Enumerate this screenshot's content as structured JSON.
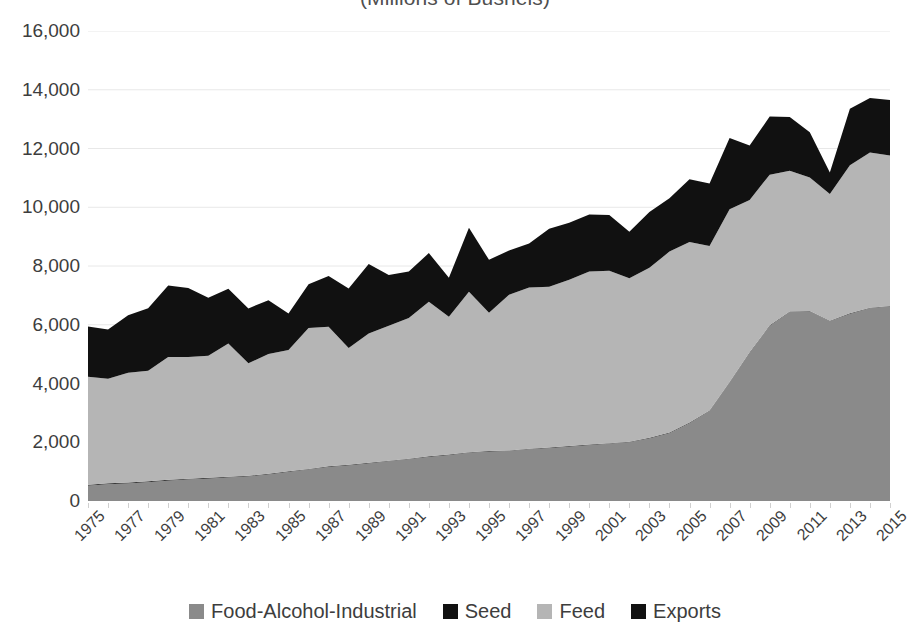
{
  "chart_data": {
    "type": "area",
    "title": "(Millions of Bushels)",
    "xlabel": "",
    "ylabel": "",
    "stacked": true,
    "grid": true,
    "legend_position": "bottom",
    "ylim": [
      0,
      16000
    ],
    "ytick_step": 2000,
    "ytick_labels": [
      "16,000",
      "14,000",
      "12,000",
      "10,000",
      "8,000",
      "6,000",
      "4,000",
      "2,000",
      "0"
    ],
    "ytick_values": [
      16000,
      14000,
      12000,
      10000,
      8000,
      6000,
      4000,
      2000,
      0
    ],
    "xlim": [
      1975,
      2015
    ],
    "xtick_labels": [
      "1975",
      "1977",
      "1979",
      "1981",
      "1983",
      "1985",
      "1987",
      "1989",
      "1991",
      "1993",
      "1995",
      "1997",
      "1999",
      "2001",
      "2003",
      "2005",
      "2007",
      "2009",
      "2011",
      "2013",
      "2015"
    ],
    "x": [
      1975,
      1976,
      1977,
      1978,
      1979,
      1980,
      1981,
      1982,
      1983,
      1984,
      1985,
      1986,
      1987,
      1988,
      1989,
      1990,
      1991,
      1992,
      1993,
      1994,
      1995,
      1996,
      1997,
      1998,
      1999,
      2000,
      2001,
      2002,
      2003,
      2004,
      2005,
      2006,
      2007,
      2008,
      2009,
      2010,
      2011,
      2012,
      2013,
      2014,
      2015
    ],
    "series": [
      {
        "name": "Food-Alcohol-Industrial",
        "color": "#8a8a8a",
        "values": [
          520,
          570,
          600,
          640,
          690,
          730,
          760,
          800,
          830,
          900,
          990,
          1070,
          1160,
          1210,
          1280,
          1350,
          1420,
          1500,
          1560,
          1640,
          1680,
          1700,
          1760,
          1800,
          1850,
          1900,
          1950,
          2000,
          2130,
          2310,
          2650,
          3060,
          4030,
          5040,
          5960,
          6430,
          6450,
          6120,
          6370,
          6560,
          6620
        ]
      },
      {
        "name": "Seed",
        "color": "#3a3a3a",
        "values": [
          30,
          32,
          30,
          30,
          30,
          30,
          28,
          28,
          26,
          26,
          24,
          22,
          22,
          22,
          22,
          22,
          20,
          20,
          20,
          20,
          20,
          20,
          20,
          20,
          20,
          20,
          20,
          20,
          20,
          20,
          20,
          20,
          20,
          20,
          20,
          20,
          20,
          20,
          20,
          20,
          20
        ]
      },
      {
        "name": "Feed",
        "color": "#b5b5b5",
        "values": [
          3680,
          3560,
          3740,
          3760,
          4180,
          4140,
          4160,
          4530,
          3830,
          4080,
          4130,
          4800,
          4750,
          3980,
          4400,
          4590,
          4790,
          5260,
          4690,
          5460,
          4710,
          5300,
          5490,
          5470,
          5660,
          5890,
          5870,
          5560,
          5790,
          6160,
          6150,
          5600,
          5880,
          5190,
          5130,
          4790,
          4540,
          4310,
          5040,
          5280,
          5120
        ]
      },
      {
        "name": "Exports",
        "color": "#111111",
        "values": [
          1710,
          1680,
          1950,
          2130,
          2440,
          2350,
          1970,
          1870,
          1870,
          1830,
          1240,
          1490,
          1730,
          2020,
          2370,
          1730,
          1580,
          1660,
          1330,
          2180,
          1800,
          1510,
          1500,
          1980,
          1940,
          1940,
          1900,
          1590,
          1900,
          1820,
          2130,
          2130,
          2430,
          1850,
          1980,
          1830,
          1540,
          730,
          1920,
          1860,
          1890
        ]
      }
    ]
  },
  "legend": {
    "items": [
      {
        "label": "Food-Alcohol-Industrial",
        "color": "#8a8a8a"
      },
      {
        "label": "Seed",
        "color": "#111111"
      },
      {
        "label": "Feed",
        "color": "#b5b5b5"
      },
      {
        "label": "Exports",
        "color": "#111111"
      }
    ]
  },
  "colors": {
    "gridline": "#e8e8e8",
    "text": "#3d3d3d",
    "background": "#ffffff"
  }
}
